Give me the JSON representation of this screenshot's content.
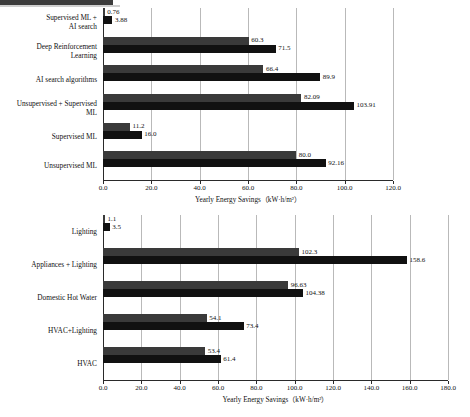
{
  "figure": {
    "cropped_caption_rule": true
  },
  "chart_data": [
    {
      "id": "top",
      "type": "bar",
      "orientation": "horizontal",
      "title": "",
      "xlabel": "Yearly Energy Savings（kW·h/m²）",
      "ylabel": "",
      "xlim": [
        0.0,
        120.0
      ],
      "xticks": [
        "0.0",
        "20.0",
        "40.0",
        "60.0",
        "80.0",
        "100.0",
        "120.0"
      ],
      "xtick_values": [
        0,
        20,
        40,
        60,
        80,
        100,
        120
      ],
      "grid": true,
      "legend": "none",
      "categories": [
        "Supervised ML + AI search",
        "Deep Reinforcement Learning",
        "AI search algorithms",
        "Unsupervised + Supervised ML",
        "Supervised ML",
        "Unsupervised ML"
      ],
      "category_lines": [
        [
          "Supervised ML +",
          "AI search"
        ],
        [
          "Deep Reinforcement",
          "Learning"
        ],
        [
          "AI search algorithms"
        ],
        [
          "Unsupervised + Supervised",
          "ML"
        ],
        [
          "Supervised ML"
        ],
        [
          "Unsupervised ML"
        ]
      ],
      "series": [
        {
          "name": "series-1",
          "color": "#3a3a3a",
          "values": [
            0.76,
            60.3,
            66.4,
            82.09,
            11.2,
            80.0
          ],
          "labels": [
            "0.76",
            "60.3",
            "66.4",
            "82.09",
            "11.2",
            "80.0"
          ]
        },
        {
          "name": "series-2",
          "color": "#111111",
          "values": [
            3.88,
            71.5,
            89.9,
            103.91,
            16.0,
            92.16
          ],
          "labels": [
            "3.88",
            "71.5",
            "89.9",
            "103.91",
            "16.0",
            "92.16"
          ]
        }
      ]
    },
    {
      "id": "bottom",
      "type": "bar",
      "orientation": "horizontal",
      "title": "",
      "xlabel": "Yearly Energy Savings（kW·h/m²）",
      "ylabel": "",
      "xlim": [
        0.0,
        180.0
      ],
      "xticks": [
        "0.0",
        "20.0",
        "40.0",
        "60.0",
        "80.0",
        "100.0",
        "120.0",
        "140.0",
        "160.0",
        "180.0"
      ],
      "xtick_values": [
        0,
        20,
        40,
        60,
        80,
        100,
        120,
        140,
        160,
        180
      ],
      "grid": true,
      "legend": "none",
      "categories": [
        "Lighting",
        "Appliances + Lighting",
        "Domestic Hot Water",
        "HVAC+Lighting",
        "HVAC"
      ],
      "category_lines": [
        [
          "Lighting"
        ],
        [
          "Appliances + Lighting"
        ],
        [
          "Domestic Hot Water"
        ],
        [
          "HVAC+Lighting"
        ],
        [
          "HVAC"
        ]
      ],
      "series": [
        {
          "name": "series-1",
          "color": "#3a3a3a",
          "values": [
            1.1,
            102.3,
            96.63,
            54.1,
            53.4
          ],
          "labels": [
            "1.1",
            "102.3",
            "96.63",
            "54.1",
            "53.4"
          ]
        },
        {
          "name": "series-2",
          "color": "#111111",
          "values": [
            3.5,
            158.6,
            104.38,
            73.4,
            61.4
          ],
          "labels": [
            "3.5",
            "158.6",
            "104.38",
            "73.4",
            "61.4"
          ]
        }
      ]
    }
  ]
}
